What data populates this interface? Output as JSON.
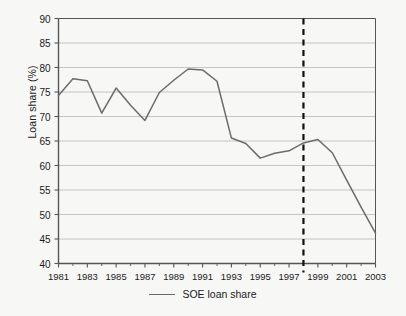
{
  "chart_data": {
    "type": "line",
    "title": "",
    "xlabel": "",
    "ylabel": "Loan share (%)",
    "xlim": [
      1981,
      2003
    ],
    "ylim": [
      40,
      90
    ],
    "grid": true,
    "grid_axis": "y",
    "legend_position": "bottom-center",
    "x": [
      1981,
      1982,
      1983,
      1984,
      1985,
      1986,
      1987,
      1988,
      1989,
      1990,
      1991,
      1992,
      1993,
      1994,
      1995,
      1996,
      1997,
      1998,
      1999,
      2000,
      2001,
      2002,
      2003
    ],
    "series": [
      {
        "name": "SOE loan share",
        "color": "#6b6b6b",
        "values": [
          74.3,
          77.7,
          77.3,
          70.7,
          75.8,
          72.3,
          69.2,
          74.9,
          77.4,
          79.7,
          79.5,
          77.2,
          65.6,
          64.5,
          61.5,
          62.5,
          63.0,
          64.6,
          65.3,
          62.6,
          57.0,
          51.5,
          46.2
        ]
      }
    ],
    "y_ticks": [
      40,
      45,
      50,
      55,
      60,
      65,
      70,
      75,
      80,
      85,
      90
    ],
    "x_ticks": [
      1981,
      1983,
      1985,
      1987,
      1989,
      1991,
      1993,
      1995,
      1997,
      1999,
      2001,
      2003
    ],
    "x_minor_ticks": [
      1982,
      1984,
      1986,
      1988,
      1990,
      1992,
      1994,
      1996,
      1998,
      2000,
      2002
    ],
    "annotations": [
      {
        "type": "vline",
        "name": "reform-marker",
        "x": 1998,
        "style": "dashed",
        "color": "#111111",
        "label": ""
      }
    ],
    "legend": [
      {
        "label": "SOE loan share",
        "color": "#6b6b6b"
      }
    ]
  },
  "colors": {
    "background": "#f7f7f6",
    "axis": "#555555",
    "grid": "#b8b8b8",
    "line": "#6b6b6b",
    "marker": "#111111",
    "text": "#1b1b1b"
  }
}
